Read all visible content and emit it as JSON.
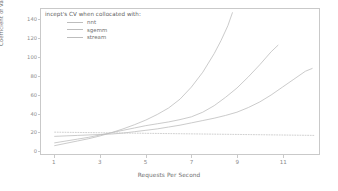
{
  "chart_data": {
    "type": "line",
    "title": "",
    "legend_title": "incept's CV when collocated with:",
    "legend_position": "upper-left",
    "xlabel": "Requests Per Second",
    "ylabel": "Coefficient of Variation [%]",
    "xlim": [
      0.4,
      12.6
    ],
    "ylim": [
      -4,
      152
    ],
    "xticks": [
      1,
      3,
      5,
      7,
      9,
      11
    ],
    "xticklabels": [
      "1",
      "3",
      "5",
      "7",
      "9",
      "11"
    ],
    "yticks": [
      0,
      20,
      40,
      60,
      80,
      100,
      120,
      140
    ],
    "yticklabels": [
      "0",
      "20",
      "40",
      "60",
      "80",
      "100",
      "120",
      "140"
    ],
    "grid": false,
    "line_color": "#bdbdbd",
    "frame_color": "#c9c9c9",
    "background": "#ffffff",
    "series": [
      {
        "name": "nnt",
        "style": "solid",
        "color": "#bdbdbd",
        "x": [
          1.0,
          1.5,
          2.0,
          2.5,
          3.0,
          3.5,
          4.0,
          4.5,
          5.0,
          5.5,
          6.0,
          6.5,
          7.0,
          7.5,
          8.0,
          8.3,
          8.6,
          8.8
        ],
        "y": [
          5.0,
          7.5,
          10.0,
          12.5,
          15.5,
          19.0,
          23.0,
          27.5,
          32.5,
          38.5,
          45.5,
          55.0,
          68.0,
          84.0,
          104.0,
          118.0,
          134.0,
          148.0
        ]
      },
      {
        "name": "sgemm",
        "style": "solid",
        "color": "#bdbdbd",
        "x": [
          1.0,
          1.5,
          2.0,
          2.5,
          3.0,
          3.5,
          4.0,
          4.5,
          5.0,
          5.5,
          6.0,
          6.5,
          7.0,
          7.5,
          8.0,
          8.5,
          9.0,
          9.5,
          10.0,
          10.5,
          10.8
        ],
        "y": [
          8.0,
          10.0,
          12.0,
          14.0,
          16.5,
          19.0,
          21.5,
          24.0,
          26.5,
          28.5,
          30.5,
          33.0,
          36.0,
          41.0,
          48.0,
          57.0,
          67.0,
          79.0,
          92.0,
          106.0,
          113.0
        ]
      },
      {
        "name": "stream",
        "style": "solid",
        "color": "#bdbdbd",
        "x": [
          1.0,
          1.5,
          2.0,
          2.5,
          3.0,
          3.5,
          4.0,
          4.5,
          5.0,
          5.5,
          6.0,
          6.5,
          7.0,
          7.5,
          8.0,
          8.5,
          9.0,
          9.5,
          10.0,
          10.5,
          11.0,
          11.5,
          12.0,
          12.3
        ],
        "y": [
          15.0,
          15.5,
          16.0,
          16.5,
          17.0,
          17.5,
          18.5,
          20.0,
          21.5,
          23.0,
          25.0,
          27.0,
          29.5,
          32.0,
          34.5,
          37.5,
          41.0,
          46.0,
          52.0,
          59.5,
          68.0,
          76.5,
          85.0,
          88.0
        ]
      },
      {
        "name": "baseline",
        "style": "dotted",
        "color": "#c4c4c4",
        "x": [
          1.0,
          12.4
        ],
        "y": [
          19.5,
          16.0
        ]
      }
    ]
  }
}
